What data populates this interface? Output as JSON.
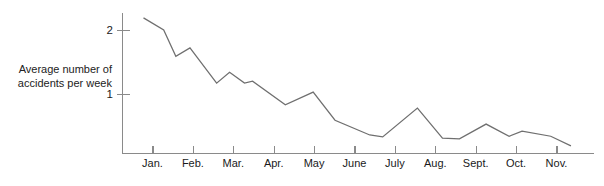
{
  "figure": {
    "background_color": "#ffffff",
    "axis_color": "#8a8a8a",
    "line_color": "#6f6f6f",
    "text_color": "#1a1a1a"
  },
  "y_axis": {
    "label_line_1": "Average number of",
    "label_line_2": "accidents per week",
    "label": "Average number of accidents per week",
    "ticks": [
      {
        "value": 1,
        "label": "1"
      },
      {
        "value": 2,
        "label": "2"
      }
    ]
  },
  "x_axis": {
    "label": "",
    "ticks": [
      {
        "label": "Jan."
      },
      {
        "label": "Feb."
      },
      {
        "label": "Mar."
      },
      {
        "label": "Apr."
      },
      {
        "label": "May"
      },
      {
        "label": "June"
      },
      {
        "label": "July"
      },
      {
        "label": "Aug."
      },
      {
        "label": "Sept."
      },
      {
        "label": "Oct."
      },
      {
        "label": "Nov."
      }
    ]
  },
  "chart_data": {
    "type": "line",
    "title": "",
    "subtitle": "",
    "xlabel": "",
    "ylabel": "Average number of accidents per week",
    "categories": [
      "Jan.",
      "Feb.",
      "Mar.",
      "Apr.",
      "May",
      "June",
      "July",
      "Aug.",
      "Sept.",
      "Oct.",
      "Nov."
    ],
    "xlim": [
      0,
      11.5
    ],
    "ylim": [
      0.08,
      2.35
    ],
    "ytick_values": [
      1,
      2
    ],
    "ytick_labels": [
      "1",
      "2"
    ],
    "grid": false,
    "legend": false,
    "legend_position": "none",
    "series": [
      {
        "name": "Average number of accidents per week",
        "color": "#6f6f6f",
        "x": [
          0.52,
          1.02,
          1.32,
          1.67,
          2.33,
          2.65,
          3.02,
          3.22,
          4.03,
          4.72,
          5.26,
          6.12,
          6.44,
          7.3,
          7.92,
          8.34,
          9.0,
          9.57,
          9.89,
          10.6,
          11.1
        ],
        "y": [
          2.19,
          2.0,
          1.59,
          1.72,
          1.17,
          1.34,
          1.17,
          1.2,
          0.83,
          1.03,
          0.59,
          0.36,
          0.33,
          0.78,
          0.31,
          0.3,
          0.53,
          0.34,
          0.42,
          0.34,
          0.19
        ],
        "points": [
          {
            "x": 0.52,
            "y": 2.19
          },
          {
            "x": 1.02,
            "y": 2.0
          },
          {
            "x": 1.32,
            "y": 1.59
          },
          {
            "x": 1.67,
            "y": 1.72
          },
          {
            "x": 2.33,
            "y": 1.17
          },
          {
            "x": 2.65,
            "y": 1.34
          },
          {
            "x": 3.02,
            "y": 1.17
          },
          {
            "x": 3.22,
            "y": 1.2
          },
          {
            "x": 4.03,
            "y": 0.83
          },
          {
            "x": 4.72,
            "y": 1.03
          },
          {
            "x": 5.26,
            "y": 0.59
          },
          {
            "x": 6.12,
            "y": 0.36
          },
          {
            "x": 6.44,
            "y": 0.33
          },
          {
            "x": 7.3,
            "y": 0.78
          },
          {
            "x": 7.92,
            "y": 0.31
          },
          {
            "x": 8.34,
            "y": 0.3
          },
          {
            "x": 9.0,
            "y": 0.53
          },
          {
            "x": 9.57,
            "y": 0.34
          },
          {
            "x": 9.89,
            "y": 0.42
          },
          {
            "x": 10.6,
            "y": 0.34
          },
          {
            "x": 11.1,
            "y": 0.19
          }
        ]
      }
    ]
  }
}
